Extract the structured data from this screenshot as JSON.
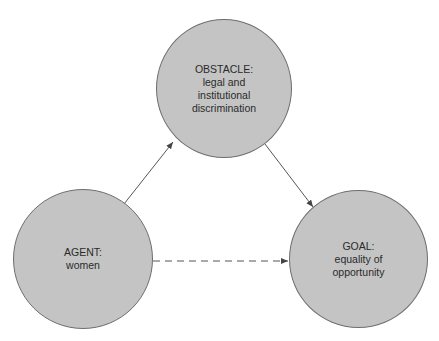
{
  "diagram": {
    "type": "triangle-flow",
    "colors": {
      "node_fill": "#c4c4c4",
      "node_stroke": "#6e6e6e",
      "edge_stroke": "#555555",
      "text": "#2a2a2a"
    },
    "nodes": {
      "obstacle": {
        "role": "OBSTACLE:",
        "desc": "legal and\ninstitutional\ndiscrimination"
      },
      "agent": {
        "role": "AGENT:",
        "desc": "women"
      },
      "goal": {
        "role": "GOAL:",
        "desc": "equality of\nopportunity"
      }
    },
    "edges": [
      {
        "from": "agent",
        "to": "obstacle",
        "style": "solid",
        "arrow": "end"
      },
      {
        "from": "obstacle",
        "to": "goal",
        "style": "solid",
        "arrow": "end"
      },
      {
        "from": "agent",
        "to": "goal",
        "style": "dashed",
        "arrow": "end"
      }
    ]
  }
}
